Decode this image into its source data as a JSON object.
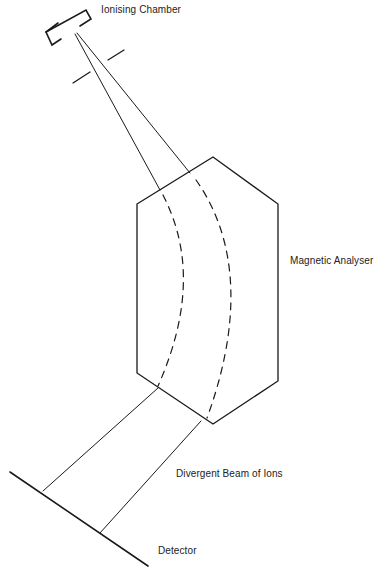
{
  "diagram": {
    "labels": {
      "ionising_chamber": "Ionising Chamber",
      "magnetic_analyser": "Magnetic Analyser",
      "divergent_beam": "Divergent Beam of Ions",
      "detector": "Detector"
    },
    "components": [
      {
        "id": "ionising-chamber",
        "label": "Ionising Chamber"
      },
      {
        "id": "collimating-slits",
        "label": ""
      },
      {
        "id": "magnetic-analyser",
        "label": "Magnetic Analyser"
      },
      {
        "id": "ion-paths",
        "label": ""
      },
      {
        "id": "divergent-beam",
        "label": "Divergent Beam of Ions"
      },
      {
        "id": "detector",
        "label": "Detector"
      }
    ],
    "colors": {
      "line": "#1a1a1a",
      "text": "#222222",
      "background": "#ffffff"
    }
  }
}
